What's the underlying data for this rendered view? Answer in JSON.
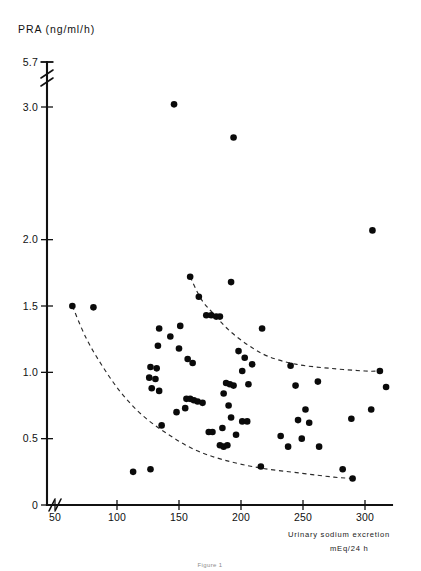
{
  "chart_data": {
    "type": "scatter",
    "title": "PRA (ng/ml/h)",
    "ylabel": "PRA (ng/ml/h)",
    "xlabel": "Urinary sodium excretion",
    "xlabel_units": "mEq/24 h",
    "caption": "Figure 1",
    "grid": false,
    "legend": "none",
    "xlim": [
      40,
      325
    ],
    "ylim": [
      0,
      5.7
    ],
    "y_axis_break": {
      "present": true,
      "between": [
        3.0,
        5.7
      ],
      "note": "axis break between 3.0 and 5.7"
    },
    "x_axis_break": {
      "present": true,
      "between": [
        0,
        50
      ],
      "note": "axis break between 0 and 50"
    },
    "xticks": [
      50,
      100,
      150,
      200,
      250,
      300
    ],
    "xtick_labels": [
      "50",
      "100",
      "150",
      "200",
      "250",
      "300"
    ],
    "yticks": [
      0,
      0.5,
      1.0,
      1.5,
      2.0,
      3.0,
      5.7
    ],
    "ytick_labels": [
      "0",
      "0.5",
      "1.0",
      "1.5",
      "2.0",
      "3.0",
      "5.7"
    ],
    "point_color": "#0a0a0a",
    "envelope_style": "dashed",
    "series": [
      {
        "name": "patients",
        "marker": "filled-circle",
        "points": [
          [
            146,
            3.02
          ],
          [
            194,
            2.77
          ],
          [
            306,
            2.07
          ],
          [
            159,
            1.72
          ],
          [
            64,
            1.5
          ],
          [
            81,
            1.49
          ],
          [
            166,
            1.57
          ],
          [
            192,
            1.68
          ],
          [
            172,
            1.43
          ],
          [
            176,
            1.43
          ],
          [
            180,
            1.42
          ],
          [
            183,
            1.42
          ],
          [
            134,
            1.33
          ],
          [
            151,
            1.35
          ],
          [
            217,
            1.33
          ],
          [
            143,
            1.27
          ],
          [
            133,
            1.2
          ],
          [
            150,
            1.18
          ],
          [
            198,
            1.16
          ],
          [
            157,
            1.1
          ],
          [
            161,
            1.07
          ],
          [
            203,
            1.11
          ],
          [
            209,
            1.06
          ],
          [
            127,
            1.04
          ],
          [
            132,
            1.03
          ],
          [
            201,
            1.01
          ],
          [
            240,
            1.05
          ],
          [
            312,
            1.01
          ],
          [
            126,
            0.96
          ],
          [
            131,
            0.95
          ],
          [
            188,
            0.92
          ],
          [
            191,
            0.91
          ],
          [
            194,
            0.9
          ],
          [
            206,
            0.91
          ],
          [
            244,
            0.9
          ],
          [
            262,
            0.93
          ],
          [
            317,
            0.89
          ],
          [
            128,
            0.88
          ],
          [
            134,
            0.86
          ],
          [
            186,
            0.84
          ],
          [
            156,
            0.8
          ],
          [
            159,
            0.8
          ],
          [
            162,
            0.79
          ],
          [
            165,
            0.78
          ],
          [
            169,
            0.77
          ],
          [
            155,
            0.73
          ],
          [
            190,
            0.75
          ],
          [
            252,
            0.72
          ],
          [
            305,
            0.72
          ],
          [
            148,
            0.7
          ],
          [
            192,
            0.66
          ],
          [
            201,
            0.63
          ],
          [
            205,
            0.63
          ],
          [
            246,
            0.64
          ],
          [
            255,
            0.62
          ],
          [
            289,
            0.65
          ],
          [
            136,
            0.6
          ],
          [
            185,
            0.58
          ],
          [
            174,
            0.55
          ],
          [
            177,
            0.55
          ],
          [
            196,
            0.53
          ],
          [
            232,
            0.52
          ],
          [
            249,
            0.5
          ],
          [
            183,
            0.45
          ],
          [
            186,
            0.44
          ],
          [
            189,
            0.45
          ],
          [
            238,
            0.44
          ],
          [
            263,
            0.44
          ],
          [
            113,
            0.25
          ],
          [
            127,
            0.27
          ],
          [
            216,
            0.29
          ],
          [
            282,
            0.27
          ],
          [
            290,
            0.2
          ]
        ]
      }
    ],
    "envelopes": [
      {
        "name": "upper-boundary",
        "style": "dashed",
        "points": [
          [
            159,
            1.72
          ],
          [
            168,
            1.55
          ],
          [
            178,
            1.44
          ],
          [
            190,
            1.32
          ],
          [
            205,
            1.21
          ],
          [
            222,
            1.12
          ],
          [
            245,
            1.06
          ],
          [
            272,
            1.03
          ],
          [
            300,
            1.01
          ],
          [
            312,
            1.01
          ]
        ]
      },
      {
        "name": "lower-boundary",
        "style": "dashed",
        "points": [
          [
            64,
            1.5
          ],
          [
            75,
            1.26
          ],
          [
            88,
            1.05
          ],
          [
            103,
            0.85
          ],
          [
            120,
            0.68
          ],
          [
            140,
            0.54
          ],
          [
            162,
            0.42
          ],
          [
            186,
            0.34
          ],
          [
            215,
            0.28
          ],
          [
            248,
            0.24
          ],
          [
            275,
            0.21
          ],
          [
            290,
            0.2
          ]
        ]
      }
    ]
  }
}
